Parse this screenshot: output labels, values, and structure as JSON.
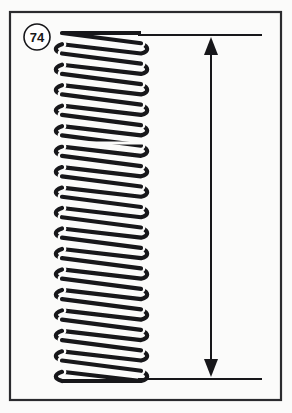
{
  "figure": {
    "kind": "technical-line-drawing",
    "background_color": "#fbfbfa",
    "ink_color": "#17171a",
    "frame": {
      "name": "figure-border",
      "x": 10,
      "y": 12,
      "width": 271,
      "height": 388,
      "stroke_width": 2.2,
      "color": "#2b2b2e"
    },
    "callout": {
      "label": "74",
      "shape": "circle",
      "cx": 37,
      "cy": 37,
      "r": 13,
      "stroke_width": 1.6
    },
    "spring": {
      "left": 62,
      "right": 141,
      "top": 33,
      "bottom": 381,
      "coil_count": 17,
      "wire_thickness": 4.2,
      "end_type": "closed-flat",
      "seam_y": 143,
      "description": "continuous helix drawn as outlined wire"
    },
    "dimension": {
      "name": "free-length-dimension",
      "line_x": 211,
      "top_y": 35,
      "bottom_y": 379,
      "stroke_width": 2.0,
      "arrow_half_width": 7,
      "arrow_length": 18,
      "arrow_style": "filled-triangle",
      "label": "",
      "extension_lines": [
        {
          "name": "top-extension-line",
          "x1": 138,
          "x2": 262,
          "y": 35
        },
        {
          "name": "bottom-extension-line",
          "x1": 138,
          "x2": 262,
          "y": 379
        }
      ]
    }
  }
}
